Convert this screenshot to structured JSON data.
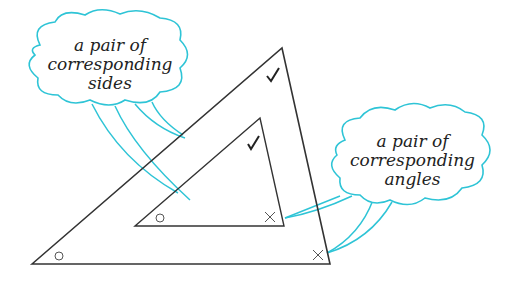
{
  "callouts": {
    "sides": {
      "line1": "a pair of",
      "line2": "corresponding",
      "line3": "sides"
    },
    "angles": {
      "line1": "a pair of",
      "line2": "corresponding",
      "line3": "angles"
    }
  },
  "marks": {
    "right_angle_mark": "✓",
    "left_angle_mark": "○",
    "bottom_right_angle_mark": "✕"
  },
  "colors": {
    "callout": "#2ec4d6",
    "line": "#333333"
  }
}
